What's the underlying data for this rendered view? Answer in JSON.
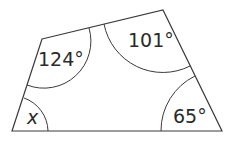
{
  "diagram": {
    "type": "quadrilateral-angles",
    "vertices": {
      "top_left": [
        42,
        39
      ],
      "top_right": [
        163,
        10
      ],
      "bottom_right": [
        222,
        131
      ],
      "bottom_left": [
        12,
        131
      ]
    },
    "angles": {
      "top_left": "124°",
      "top_right": "101°",
      "bottom_right": "65°",
      "bottom_left": "x"
    },
    "colors": {
      "stroke": "#3a3a3a",
      "text": "#2a2a2a",
      "background": "#ffffff"
    }
  }
}
